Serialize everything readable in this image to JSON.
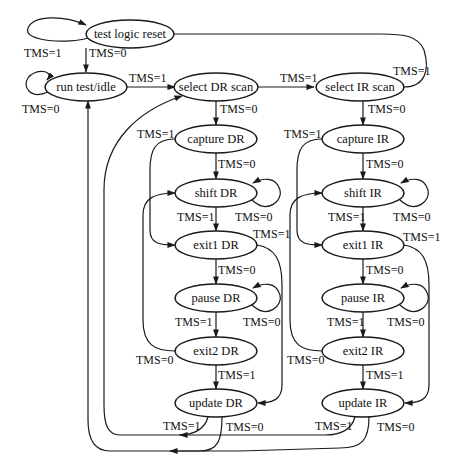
{
  "diagram": {
    "colors": {
      "stroke": "#1a1a1a",
      "background": "#ffffff",
      "text": "#111111"
    },
    "states": {
      "test_logic_reset": "test logic reset",
      "run_test_idle": "run test/idle",
      "select_dr_scan": "select DR scan",
      "select_ir_scan": "select IR scan",
      "capture_dr": "capture DR",
      "shift_dr": "shift DR",
      "exit1_dr": "exit1 DR",
      "pause_dr": "pause DR",
      "exit2_dr": "exit2 DR",
      "update_dr": "update DR",
      "capture_ir": "capture IR",
      "shift_ir": "shift IR",
      "exit1_ir": "exit1 IR",
      "pause_ir": "pause IR",
      "exit2_ir": "exit2 IR",
      "update_ir": "update IR"
    },
    "transitions": {
      "tlr_self": "TMS=1",
      "tlr_to_rti": "TMS=0",
      "rti_self": "TMS=0",
      "rti_to_seldr": "TMS=1",
      "seldr_to_selir": "TMS=1",
      "selir_to_tlr": "TMS=1",
      "seldr_to_capdr": "TMS=0",
      "selir_to_capir": "TMS=0",
      "capdr_to_exit1dr": "TMS=1",
      "capdr_to_shiftdr": "TMS=0",
      "shiftdr_self": "TMS=0",
      "shiftdr_to_exit1dr": "TMS=1",
      "exit1dr_to_updatedr": "TMS=1",
      "exit1dr_to_pausedr": "TMS=0",
      "pausedr_self": "TMS=0",
      "pausedr_to_exit2dr": "TMS=1",
      "exit2dr_to_shiftdr": "TMS=0",
      "exit2dr_to_updatedr": "TMS=1",
      "updatedr_to_seldr": "TMS=1",
      "updatedr_to_rti": "TMS=0",
      "capir_to_exit1ir": "TMS=1",
      "capir_to_shiftir": "TMS=0",
      "shiftir_self": "TMS=0",
      "shiftir_to_exit1ir": "TMS=1",
      "exit1ir_to_updateir": "TMS=1",
      "exit1ir_to_pauseir": "TMS=0",
      "pauseir_self": "TMS=0",
      "pauseir_to_exit2ir": "TMS=1",
      "exit2ir_to_shiftir": "TMS=0",
      "exit2ir_to_updateir": "TMS=1",
      "updateir_to_seldr": "TMS=1",
      "updateir_to_rti": "TMS=0"
    }
  }
}
